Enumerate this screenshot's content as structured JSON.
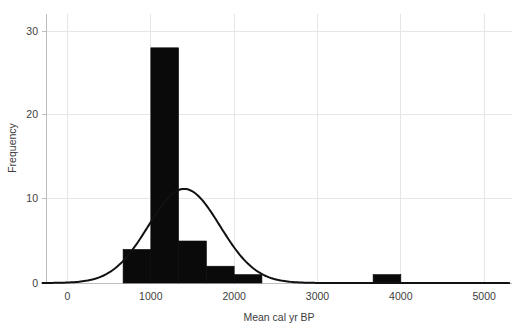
{
  "chart_data": {
    "type": "bar",
    "title": "",
    "subtitle": "",
    "xlabel": "Mean cal yr BP",
    "ylabel": "Frequency",
    "xlim": [
      -300,
      5300
    ],
    "ylim": [
      0,
      31
    ],
    "xticks": [
      0,
      1000,
      2000,
      3000,
      4000,
      5000
    ],
    "xtick_labels": [
      "0",
      "1000",
      "2000",
      "3000",
      "4000",
      "5000"
    ],
    "yticks": [
      0,
      10,
      20,
      30
    ],
    "ytick_labels": [
      "0",
      "10",
      "20",
      "30"
    ],
    "grid": true,
    "grid_axis": "both",
    "legend": null,
    "legend_position": "none",
    "bin_width": 333,
    "bar_color": "#0a0a0a",
    "bins": [
      {
        "x0": 667,
        "x1": 1000,
        "value": 4
      },
      {
        "x0": 1000,
        "x1": 1333,
        "value": 28
      },
      {
        "x0": 1333,
        "x1": 1667,
        "value": 5
      },
      {
        "x0": 1667,
        "x1": 2000,
        "value": 2
      },
      {
        "x0": 2000,
        "x1": 2333,
        "value": 1
      },
      {
        "x0": 3667,
        "x1": 4000,
        "value": 1
      }
    ],
    "categories": [
      "667-1000",
      "1000-1333",
      "1333-1667",
      "1667-2000",
      "2000-2333",
      "3667-4000"
    ],
    "values": [
      4,
      28,
      5,
      2,
      1,
      1
    ],
    "overlay_curve": {
      "type": "normal-density",
      "name": "normal curve",
      "color": "#111111",
      "mean": 1400,
      "sd": 430,
      "peak_value": 11.2
    }
  },
  "axes": {
    "x_title": "Mean cal yr BP",
    "y_title": "Frequency"
  }
}
